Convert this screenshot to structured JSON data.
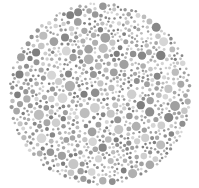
{
  "plate": {
    "type": "ishihara-style dot plate (grayscale)",
    "center": [
      100,
      94
    ],
    "radius": 92,
    "background": "#ffffff",
    "palette": {
      "dark": [
        "#7f7f7f",
        "#878787",
        "#8f8f8f",
        "#979797"
      ],
      "mid": [
        "#a0a0a0",
        "#a8a8a8",
        "#b0b0b0"
      ],
      "light": [
        "#bdbdbd",
        "#c6c6c6",
        "#cfcfcf",
        "#d6d6d6"
      ]
    },
    "dot_radius_range": [
      1.2,
      5.2
    ],
    "dot_count": 900,
    "seed": 7
  }
}
